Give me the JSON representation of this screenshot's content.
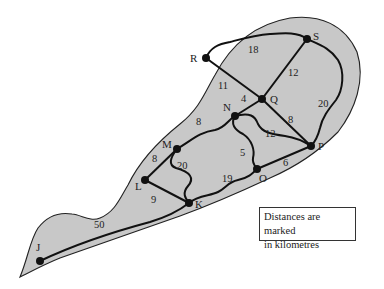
{
  "diagram": {
    "type": "weighted-network-on-island",
    "nodes": [
      {
        "id": "J",
        "x": 40,
        "y": 261
      },
      {
        "id": "K",
        "x": 189,
        "y": 203
      },
      {
        "id": "L",
        "x": 145,
        "y": 180
      },
      {
        "id": "M",
        "x": 177,
        "y": 149
      },
      {
        "id": "N",
        "x": 235,
        "y": 116
      },
      {
        "id": "O",
        "x": 257,
        "y": 169
      },
      {
        "id": "P",
        "x": 311,
        "y": 146
      },
      {
        "id": "Q",
        "x": 262,
        "y": 99
      },
      {
        "id": "R",
        "x": 206,
        "y": 58
      },
      {
        "id": "S",
        "x": 307,
        "y": 39
      }
    ],
    "edges": [
      {
        "from": "J",
        "to": "K",
        "weight": "50"
      },
      {
        "from": "L",
        "to": "K",
        "weight": "9"
      },
      {
        "from": "L",
        "to": "M",
        "weight": "8"
      },
      {
        "from": "M",
        "to": "K",
        "weight": "20"
      },
      {
        "from": "M",
        "to": "N",
        "weight": "8"
      },
      {
        "from": "K",
        "to": "O",
        "weight": "19"
      },
      {
        "from": "N",
        "to": "O",
        "weight": "5"
      },
      {
        "from": "O",
        "to": "P",
        "weight": "6"
      },
      {
        "from": "N",
        "to": "P",
        "weight": "12"
      },
      {
        "from": "N",
        "to": "Q",
        "weight": "4"
      },
      {
        "from": "Q",
        "to": "P",
        "weight": "8"
      },
      {
        "from": "R",
        "to": "Q",
        "weight": "11"
      },
      {
        "from": "R",
        "to": "S",
        "weight": "18"
      },
      {
        "from": "S",
        "to": "Q",
        "weight": "12"
      },
      {
        "from": "S",
        "to": "P",
        "weight": "20"
      }
    ],
    "note": {
      "line1": "Distances are marked",
      "line2": "in kilometres"
    }
  }
}
